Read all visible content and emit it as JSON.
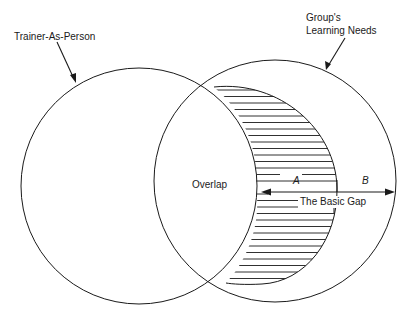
{
  "diagram": {
    "type": "venn",
    "labels": {
      "left_circle": "Trainer-As-Person",
      "right_circle_line1": "Group's",
      "right_circle_line2": "Learning Needs",
      "overlap": "Overlap",
      "segment_a": "A",
      "segment_b": "B",
      "gap": "The Basic Gap"
    },
    "colors": {
      "stroke": "#1a1a1a",
      "background": "#ffffff"
    }
  }
}
